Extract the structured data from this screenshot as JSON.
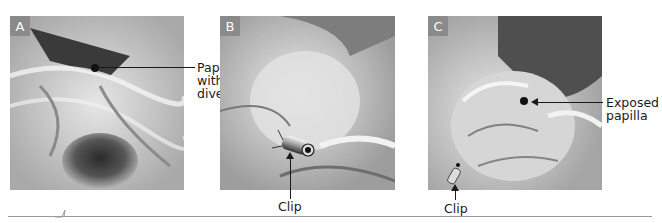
{
  "figure": {
    "panels": [
      {
        "id": "A",
        "badge": "A",
        "description": "Endoscopic view of duodenal wall with papilla located inside a diverticulum; lumen opening below",
        "annotations": [
          {
            "text_lines": [
              "Papilla",
              "within",
              "diverticulum"
            ]
          }
        ]
      },
      {
        "id": "B",
        "badge": "B",
        "description": "Mucosal fold with clip applied to evert the papilla",
        "annotations": [
          {
            "text_lines": [
              "Clip"
            ]
          }
        ]
      },
      {
        "id": "C",
        "badge": "C",
        "description": "Papilla exposed after clip placement",
        "annotations": [
          {
            "text_lines": [
              "Exposed",
              "papilla"
            ]
          },
          {
            "text_lines": [
              "Clip"
            ]
          }
        ]
      }
    ]
  },
  "colors": {
    "badge_bg": "#8a8a8a",
    "badge_text": "#ffffff",
    "label_text": "#1a1a1a",
    "footer_rule": "#9a9a9a"
  }
}
